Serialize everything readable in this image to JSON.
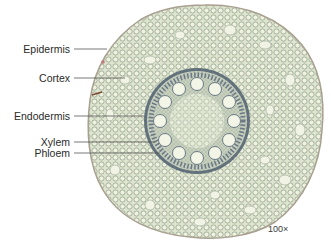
{
  "figure": {
    "magnification": "100×",
    "labels": [
      {
        "text": "Epidermis",
        "y": 49,
        "x_end": 107
      },
      {
        "text": "Cortex",
        "y": 78,
        "x_end": 125
      },
      {
        "text": "Endodermis",
        "y": 116,
        "x_end": 145
      },
      {
        "text": "Xylem",
        "y": 142,
        "x_end": 155
      },
      {
        "text": "Phloem",
        "y": 153,
        "x_end": 160
      }
    ]
  },
  "colors": {
    "tissue_fill": "#d9e2cc",
    "cell_wall": "#8a9a86",
    "stele_ring": "#5a6a7a",
    "vessel_fill": "#eef2e0",
    "leader_line": "#555555"
  }
}
